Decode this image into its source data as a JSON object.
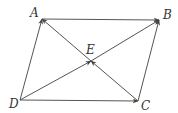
{
  "diagram": {
    "type": "parallelogram-vectors",
    "colors": {
      "line": "#555555",
      "label": "#333333",
      "background": "#ffffff"
    },
    "points": {
      "A": {
        "label": "A",
        "x": 42,
        "y": 19,
        "label_x": 30,
        "label_y": 17
      },
      "B": {
        "label": "B",
        "x": 159,
        "y": 20,
        "label_x": 163,
        "label_y": 19
      },
      "C": {
        "label": "C",
        "x": 138,
        "y": 101,
        "label_x": 141,
        "label_y": 110
      },
      "D": {
        "label": "D",
        "x": 20,
        "y": 100,
        "label_x": 9,
        "label_y": 108
      },
      "E": {
        "label": "E",
        "x": 91,
        "y": 61,
        "label_x": 86,
        "label_y": 54
      }
    },
    "vectors": [
      {
        "from": "D",
        "to": "A"
      },
      {
        "from": "A",
        "to": "B"
      },
      {
        "from": "D",
        "to": "C"
      },
      {
        "from": "C",
        "to": "B"
      },
      {
        "from": "D",
        "to": "E"
      },
      {
        "from": "E",
        "to": "B"
      },
      {
        "from": "C",
        "to": "E"
      },
      {
        "from": "E",
        "to": "A"
      }
    ]
  }
}
